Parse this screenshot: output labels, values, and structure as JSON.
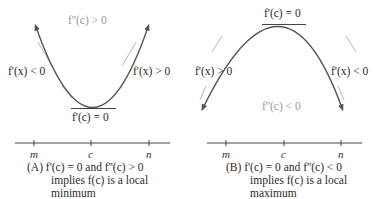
{
  "panels": [
    {
      "id": "A",
      "concavity_label": "f''(c) > 0",
      "left_slope_label": "f'(x) < 0",
      "right_slope_label": "f'(x) > 0",
      "tangent_label": "f'(c) = 0",
      "axis_ticks": [
        "m",
        "c",
        "n"
      ],
      "caption": {
        "tag": "(A)",
        "line1": "f'(c) = 0 and f''(c) > 0",
        "line2": "implies f(c) is a local",
        "line3": "minimum"
      }
    },
    {
      "id": "B",
      "concavity_label": "f''(c) < 0",
      "left_slope_label": "f'(x) > 0",
      "right_slope_label": "f'(x) < 0",
      "tangent_label": "f'(c) = 0",
      "axis_ticks": [
        "m",
        "c",
        "n"
      ],
      "caption": {
        "tag": "(B)",
        "line1": "f'(c) = 0 and f''(c) < 0",
        "line2": "implies f(c) is a local",
        "line3": "maximum"
      }
    }
  ],
  "colors": {
    "curve": "#555555",
    "tangent": "#9a9a9a",
    "text": "#2b2b2b",
    "concavity_text": "#9a9a9a"
  }
}
